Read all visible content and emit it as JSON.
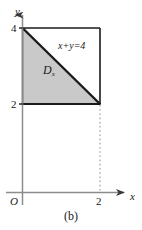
{
  "figure": {
    "caption": "(b)",
    "axes": {
      "x_label": "x",
      "y_label": "y",
      "origin_label": "O",
      "x_ticks": [
        "2"
      ],
      "y_ticks": [
        "4",
        "2"
      ]
    },
    "annotations": {
      "region_label": "D",
      "region_subscript": "x",
      "boundary_equation": "x+y=4"
    },
    "colors": {
      "shade_fill": "#c9c9c9",
      "boundary_stroke": "#1a1a1a",
      "axis_stroke": "#8c8c8c",
      "dotted_stroke": "#b4b4b4",
      "background": "#ffffff"
    },
    "geometry": {
      "description": "Triangular region bounded by x=0, y=2 and the line x+y=4, inside the square [0,2]x[2,4]",
      "square_corners": [
        [
          0,
          4
        ],
        [
          2,
          4
        ],
        [
          2,
          2
        ],
        [
          0,
          2
        ]
      ],
      "shaded_triangle_vertices": [
        [
          0,
          4
        ],
        [
          0,
          2
        ],
        [
          2,
          2
        ]
      ],
      "line_endpoints": [
        [
          0,
          4
        ],
        [
          2,
          2
        ]
      ],
      "dotted_guide": {
        "from": [
          2,
          2
        ],
        "to": [
          2,
          0
        ]
      }
    }
  }
}
